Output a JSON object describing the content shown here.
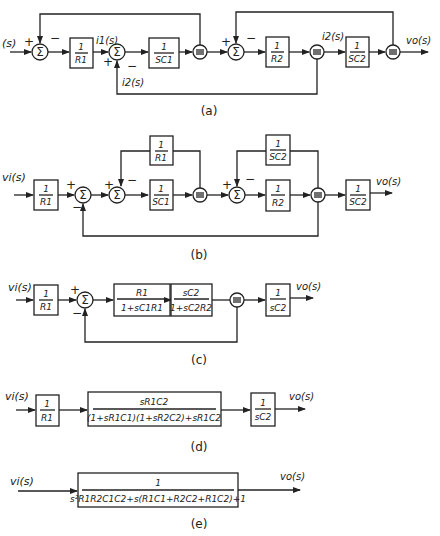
{
  "diagrams": {
    "a": {
      "caption": "(a)",
      "input": "(s)",
      "output": "vo(s)",
      "i1": "i1(s)",
      "i2_feedback": "i2(s)",
      "i2_node": "i2(s)",
      "blocks": [
        {
          "num": "1",
          "den": "R1"
        },
        {
          "num": "1",
          "den": "SC1"
        },
        {
          "num": "1",
          "den": "R2"
        },
        {
          "num": "1",
          "den": "SC2"
        }
      ],
      "signs": {
        "s1_in": "+",
        "s1_fb": "−",
        "s2_in": "+",
        "s2_fb": "−",
        "s3_in": "+",
        "s3_fb": "−"
      }
    },
    "b": {
      "caption": "(b)",
      "input": "vi(s)",
      "output": "vo(s)",
      "blocks": [
        {
          "num": "1",
          "den": "R1"
        },
        {
          "num": "1",
          "den": "R1"
        },
        {
          "num": "1",
          "den": "SC1"
        },
        {
          "num": "1",
          "den": "SC2"
        },
        {
          "num": "1",
          "den": "R2"
        },
        {
          "num": "1",
          "den": "SC2"
        }
      ],
      "signs": {
        "s1_in": "+",
        "s1_fb": "−",
        "s2_in": "+",
        "s2_fb": "−",
        "s3_in": "+",
        "s3_fb": "−"
      }
    },
    "c": {
      "caption": "(c)",
      "input": "vi(s)",
      "output": "vo(s)",
      "blocks": [
        {
          "num": "1",
          "den": "R1"
        },
        {
          "num": "R1",
          "den": "1+sC1R1"
        },
        {
          "num": "sC2",
          "den": "1+sC2R2"
        },
        {
          "num": "1",
          "den": "sC2"
        }
      ],
      "signs": {
        "s1_in": "+",
        "s1_fb": "−"
      }
    },
    "d": {
      "caption": "(d)",
      "input": "vi(s)",
      "output": "vo(s)",
      "blocks": [
        {
          "num": "1",
          "den": "R1"
        },
        {
          "num": "sR1C2",
          "den": "(1+sR1C1)(1+sR2C2)+sR1C2"
        },
        {
          "num": "1",
          "den": "sC2"
        }
      ]
    },
    "e": {
      "caption": "(e)",
      "input": "vi(s)",
      "output": "vo(s)",
      "blocks": [
        {
          "num": "1",
          "den": "s²R1R2C1C2+s(R1C1+R2C2+R1C2)+1"
        }
      ]
    }
  }
}
